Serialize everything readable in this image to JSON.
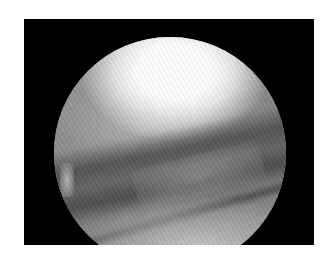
{
  "image": {
    "kind": "arthroscopic-view",
    "description": "Grayscale circular endoscopic view inside a black rectangular frame on white background",
    "colors": {
      "page_background": "#ffffff",
      "frame": "#000000",
      "highlight": "#ffffff",
      "midtone": "#8a8a8a",
      "shadow": "#5a5a5a"
    }
  }
}
